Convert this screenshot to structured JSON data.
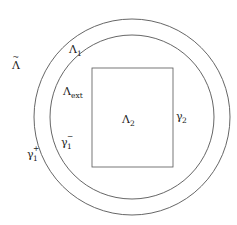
{
  "diagram": {
    "type": "domain-geometry",
    "stroke_color": "#555555",
    "background": "#ffffff",
    "shapes": {
      "outer_circle": {
        "cx": 132,
        "cy": 117,
        "r": 98,
        "boundary_label": "γ1+"
      },
      "inner_circle": {
        "cx": 132,
        "cy": 117,
        "r": 82,
        "boundary_label": "γ1−"
      },
      "rectangle": {
        "x": 92,
        "y": 68,
        "width": 81,
        "height": 99,
        "boundary_label": "γ2"
      }
    },
    "labels": {
      "lambda_tilde": {
        "base": "Λ",
        "accent": "~",
        "sub": ""
      },
      "lambda_1": {
        "base": "Λ",
        "sub": "1"
      },
      "lambda_ext": {
        "base": "Λ",
        "sub": "ext"
      },
      "lambda_2": {
        "base": "Λ",
        "sub": "2"
      },
      "gamma_2": {
        "base": "γ",
        "sub": "2"
      },
      "gamma_1_minus": {
        "base": "γ",
        "sub": "1",
        "sup": "−"
      },
      "gamma_1_plus": {
        "base": "γ",
        "sub": "1",
        "sup": "+"
      }
    }
  }
}
